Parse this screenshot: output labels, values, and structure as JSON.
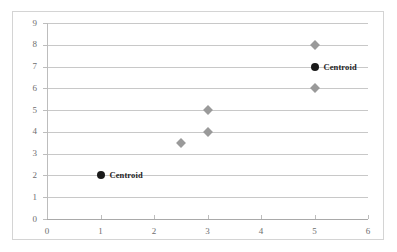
{
  "chart_data": {
    "type": "scatter",
    "title": "",
    "xlabel": "",
    "ylabel": "",
    "xlim": [
      0,
      6
    ],
    "ylim": [
      0,
      9
    ],
    "x_ticks": [
      0,
      1,
      2,
      3,
      4,
      5,
      6
    ],
    "y_ticks": [
      0,
      1,
      2,
      3,
      4,
      5,
      6,
      7,
      8,
      9
    ],
    "x_tick_labels": [
      "0",
      "1",
      "2",
      "3",
      "4",
      "5",
      "6"
    ],
    "y_tick_labels": [
      "0",
      "1",
      "2",
      "3",
      "4",
      "5",
      "6",
      "7",
      "8",
      "9"
    ],
    "grid": "horizontal",
    "legend": "none",
    "series": [
      {
        "name": "data-points",
        "marker": "diamond",
        "color": "#9a9a9a",
        "points": [
          {
            "x": 2.5,
            "y": 3.5
          },
          {
            "x": 3,
            "y": 4
          },
          {
            "x": 3,
            "y": 5
          },
          {
            "x": 5,
            "y": 6
          },
          {
            "x": 5,
            "y": 8
          }
        ]
      },
      {
        "name": "centroids",
        "marker": "circle",
        "color": "#1a1a1a",
        "points": [
          {
            "x": 1,
            "y": 2,
            "label": "Centroid"
          },
          {
            "x": 5,
            "y": 7,
            "label": "Centroid"
          }
        ]
      }
    ],
    "annotations": [
      {
        "text": "Centroid",
        "x": 1,
        "y": 2
      },
      {
        "text": "Centroid",
        "x": 5,
        "y": 7
      }
    ],
    "colors": {
      "data_marker": "#9a9a9a",
      "centroid_marker": "#1a1a1a",
      "gridline": "#c8c8c8",
      "axis": "#bdbdbd",
      "tick_label": "#6e6e6e",
      "frame_border": "#d4d4d4",
      "background": "#ffffff"
    }
  }
}
